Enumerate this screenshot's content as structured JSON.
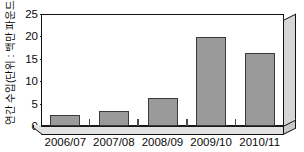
{
  "chart_data": {
    "type": "bar",
    "title": "",
    "subtitle": "",
    "xlabel": "",
    "ylabel": "연간 수입(단위 : 백만 파운드)",
    "categories": [
      "2006/07",
      "2007/08",
      "2008/09",
      "2009/10",
      "2010/11"
    ],
    "values": [
      2.4,
      3.3,
      6.3,
      19.8,
      16.2
    ],
    "series": [
      {
        "name": "연간 수입",
        "values": [
          2.4,
          3.3,
          6.3,
          19.8,
          16.2
        ]
      }
    ],
    "ylim": [
      0,
      25
    ],
    "ytick_labels": [
      "0",
      "5",
      "10",
      "15",
      "20",
      "25"
    ],
    "ytick_values": [
      0,
      5,
      10,
      15,
      20,
      25
    ],
    "grid": false,
    "legend": false,
    "legend_position": "none",
    "style": "3d",
    "bar_color": "#9a9a9a",
    "bar_border_color": "#3a3a3a",
    "axis_color": "#111111",
    "plot_background": "#ffffff",
    "wall_color": "#d6d6d6",
    "floor_color": "#e2e2e2"
  }
}
